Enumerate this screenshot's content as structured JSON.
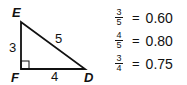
{
  "triangle": {
    "vertices": {
      "E": "E",
      "F": "F",
      "D": "D"
    },
    "sides": {
      "EF": "3",
      "FD": "4",
      "ED": "5"
    },
    "right_angle_at": "F",
    "stroke_color": "#111111"
  },
  "equations": [
    {
      "numerator": "3",
      "denominator": "5",
      "equals": "=",
      "value": "0.60"
    },
    {
      "numerator": "4",
      "denominator": "5",
      "equals": "=",
      "value": "0.80"
    },
    {
      "numerator": "3",
      "denominator": "4",
      "equals": "=",
      "value": "0.75"
    }
  ]
}
